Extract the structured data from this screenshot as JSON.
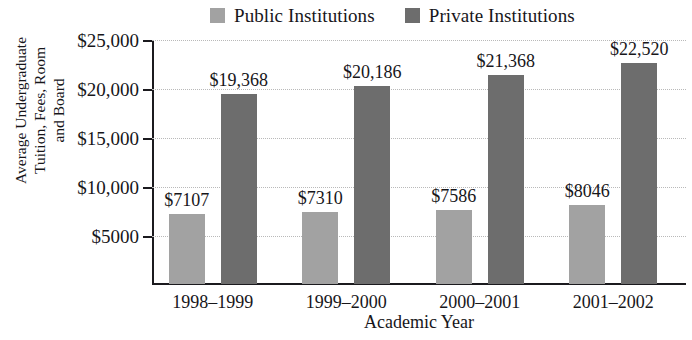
{
  "chart_data": {
    "type": "bar",
    "title": "",
    "xlabel": "Academic Year",
    "ylabel_lines": [
      "Average Undergraduate",
      "Tuition, Fees, Room",
      "and Board"
    ],
    "ylabel": "Average Undergraduate Tuition, Fees, Room and Board",
    "categories": [
      "1998–1999",
      "1999–2000",
      "2000–2001",
      "2001–2002"
    ],
    "series": [
      {
        "name": "Public Institutions",
        "color": "#a2a2a2",
        "values": [
          7107,
          7310,
          7586,
          8046
        ],
        "labels": [
          "$7107",
          "$7310",
          "$7586",
          "$8046"
        ]
      },
      {
        "name": "Private Institutions",
        "color": "#6d6d6d",
        "values": [
          19368,
          20186,
          21368,
          22520
        ],
        "labels": [
          "$19,368",
          "$20,186",
          "$21,368",
          "$22,520"
        ]
      }
    ],
    "ylim": [
      0,
      25000
    ],
    "yticks": [
      5000,
      10000,
      15000,
      20000,
      25000
    ],
    "ytick_labels": [
      "$5000",
      "$10,000",
      "$15,000",
      "$20,000",
      "$25,000"
    ],
    "grid": true,
    "legend_position": "top-center",
    "axis_color": "#1b1a1e",
    "gridline_color": "#b9b9b9",
    "background": "#ffffff"
  },
  "legend": {
    "entries": [
      {
        "label": "Public Institutions",
        "color": "#a2a2a2"
      },
      {
        "label": "Private Institutions",
        "color": "#6d6d6d"
      }
    ]
  }
}
